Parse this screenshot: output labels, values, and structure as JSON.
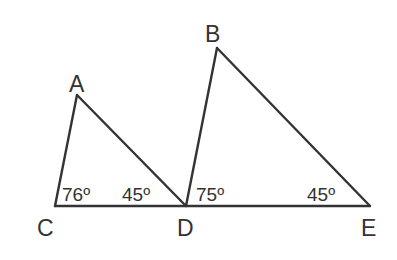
{
  "diagram": {
    "type": "geometry",
    "vertices": {
      "A": {
        "label": "A",
        "x": 77,
        "y": 95
      },
      "B": {
        "label": "B",
        "x": 217,
        "y": 48
      },
      "C": {
        "label": "C",
        "x": 55,
        "y": 206
      },
      "D": {
        "label": "D",
        "x": 186,
        "y": 206
      },
      "E": {
        "label": "E",
        "x": 370,
        "y": 206
      }
    },
    "triangles": [
      {
        "name": "ACD",
        "vertices": [
          "A",
          "C",
          "D"
        ]
      },
      {
        "name": "BDE",
        "vertices": [
          "B",
          "D",
          "E"
        ]
      }
    ],
    "angles": {
      "C": {
        "vertex": "C",
        "value": "76º"
      },
      "D_in_ACD": {
        "vertex": "D",
        "value": "45º"
      },
      "D_in_BDE": {
        "vertex": "D",
        "value": "75º"
      },
      "E": {
        "vertex": "E",
        "value": "45º"
      }
    },
    "colors": {
      "line": "#333333",
      "text": "#333333",
      "background": "#ffffff"
    }
  }
}
